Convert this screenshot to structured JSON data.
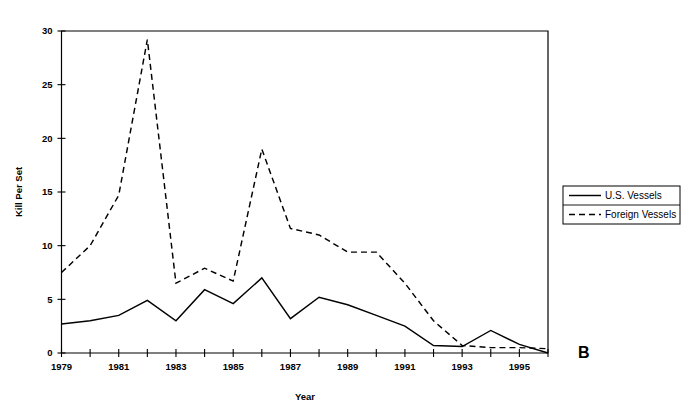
{
  "chart_data": {
    "type": "line",
    "title": "",
    "panel_label": "B",
    "xlabel": "Year",
    "ylabel": "Kill Per Set",
    "x": [
      1979,
      1980,
      1981,
      1982,
      1983,
      1984,
      1985,
      1986,
      1987,
      1988,
      1989,
      1990,
      1991,
      1992,
      1993,
      1994,
      1995,
      1996
    ],
    "xlim": [
      1979,
      1996
    ],
    "ylim": [
      0,
      30
    ],
    "yticks": [
      0,
      5,
      10,
      15,
      20,
      25,
      30
    ],
    "ytick_labels": [
      "0",
      "5",
      "10",
      "15",
      "20",
      "25",
      "30"
    ],
    "xticks": [
      1979,
      1980,
      1981,
      1982,
      1983,
      1984,
      1985,
      1986,
      1987,
      1988,
      1989,
      1990,
      1991,
      1992,
      1993,
      1994,
      1995,
      1996
    ],
    "xtick_labels": [
      "1979",
      "",
      "1981",
      "",
      "1983",
      "",
      "1985",
      "",
      "1987",
      "",
      "1989",
      "",
      "1991",
      "",
      "1993",
      "",
      "1995",
      ""
    ],
    "grid": false,
    "legend_position": "outside right",
    "series": [
      {
        "name": "U.S. Vessels",
        "style": "solid",
        "color": "#000000",
        "values": [
          2.7,
          3.0,
          3.5,
          4.9,
          3.0,
          5.9,
          4.6,
          7.0,
          3.2,
          5.2,
          4.5,
          3.5,
          2.5,
          0.7,
          0.6,
          2.1,
          0.8,
          0.0
        ]
      },
      {
        "name": "Foreign Vessels",
        "style": "dashed",
        "color": "#000000",
        "values": [
          7.5,
          10.0,
          14.7,
          29.2,
          6.5,
          7.9,
          6.7,
          19.0,
          11.6,
          11.0,
          9.4,
          9.4,
          6.5,
          3.0,
          0.7,
          0.5,
          0.5,
          0.4
        ]
      }
    ]
  },
  "legend": {
    "items": [
      {
        "label": "U.S. Vessels",
        "style": "solid"
      },
      {
        "label": "Foreign Vessels",
        "style": "dashed"
      }
    ]
  }
}
